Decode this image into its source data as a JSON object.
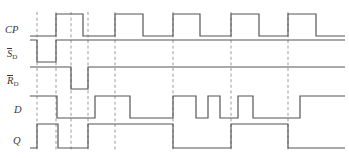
{
  "figure": {
    "kind": "digital-timing-diagram",
    "title": "",
    "width": 349,
    "height": 158,
    "background": "#ffffff",
    "trace_color": "#555555",
    "marker_color": "#9a9a9a",
    "label_color": "#3a3a3a"
  },
  "labels": {
    "cp": "CP",
    "sd_base": "S",
    "sd_sub": "D",
    "rd_base": "R",
    "rd_sub": "D",
    "d": "D",
    "q": "Q"
  },
  "axis": {
    "x_start": 30,
    "x_end": 345,
    "marker_x": [
      37,
      56,
      71,
      88,
      115,
      173,
      231,
      288
    ]
  },
  "chart_data": {
    "type": "line",
    "xlabel": "",
    "ylabel": "",
    "grid": "vertical-dashed-markers",
    "legend": "row-labels-left",
    "signals": [
      {
        "name": "CP",
        "label": "CP",
        "row_top": 14,
        "row_bottom": 36,
        "initial": 0,
        "transitions": [
          {
            "x": 56,
            "level": 1
          },
          {
            "x": 83,
            "level": 0
          },
          {
            "x": 115,
            "level": 1
          },
          {
            "x": 143,
            "level": 0
          },
          {
            "x": 173,
            "level": 1
          },
          {
            "x": 200,
            "level": 0
          },
          {
            "x": 231,
            "level": 1
          },
          {
            "x": 259,
            "level": 0
          },
          {
            "x": 288,
            "level": 1
          },
          {
            "x": 316,
            "level": 0
          }
        ]
      },
      {
        "name": "SD_bar",
        "label": "S̄D",
        "row_top": 40,
        "row_bottom": 62,
        "initial": 1,
        "transitions": [
          {
            "x": 37,
            "level": 0
          },
          {
            "x": 56,
            "level": 1
          }
        ]
      },
      {
        "name": "RD_bar",
        "label": "R̄D",
        "row_top": 67,
        "row_bottom": 89,
        "initial": 1,
        "transitions": [
          {
            "x": 71,
            "level": 0
          },
          {
            "x": 88,
            "level": 1
          }
        ]
      },
      {
        "name": "D",
        "label": "D",
        "row_top": 96,
        "row_bottom": 118,
        "initial": 1,
        "transitions": [
          {
            "x": 57,
            "level": 0
          },
          {
            "x": 95,
            "level": 1
          },
          {
            "x": 130,
            "level": 0
          },
          {
            "x": 173,
            "level": 1
          },
          {
            "x": 196,
            "level": 0
          },
          {
            "x": 208,
            "level": 1
          },
          {
            "x": 220,
            "level": 0
          },
          {
            "x": 238,
            "level": 1
          },
          {
            "x": 253,
            "level": 0
          },
          {
            "x": 300,
            "level": 1
          }
        ]
      },
      {
        "name": "Q",
        "label": "Q",
        "row_top": 124,
        "row_bottom": 148,
        "initial": 0,
        "transitions": [
          {
            "x": 37,
            "level": 1
          },
          {
            "x": 58,
            "level": 0
          },
          {
            "x": 88,
            "level": 1
          },
          {
            "x": 173,
            "level": 0
          },
          {
            "x": 231,
            "level": 1
          },
          {
            "x": 288,
            "level": 0
          }
        ]
      }
    ]
  }
}
